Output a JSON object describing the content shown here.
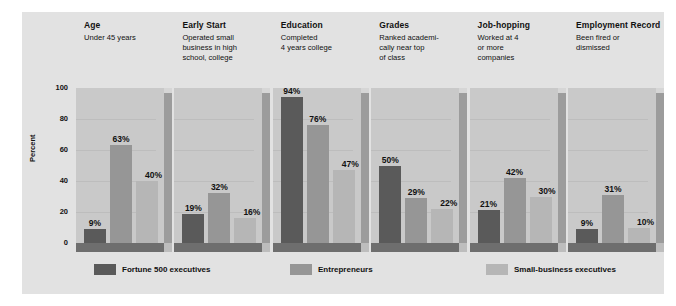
{
  "chart_data": {
    "type": "bar",
    "title": "",
    "xlabel": "",
    "ylabel": "Percent",
    "ylim": [
      0,
      100
    ],
    "yticks": [
      0,
      20,
      40,
      60,
      80,
      100
    ],
    "grid": true,
    "legend_position": "bottom",
    "categories": [
      "Age",
      "Early Start",
      "Education",
      "Grades",
      "Job-hopping",
      "Employment Record"
    ],
    "category_subtitles": [
      "Under 45 years",
      "Operated small\nbusiness in high\nschool, college",
      "Completed\n4 years college",
      "Ranked academi-\ncally near top\nof class",
      "Worked at 4\nor more\ncompanies",
      "Been fired or\ndismissed"
    ],
    "series": [
      {
        "name": "Fortune 500 executives",
        "color": "#5a5a5a",
        "values": [
          9,
          19,
          94,
          50,
          21,
          9
        ]
      },
      {
        "name": "Entrepreneurs",
        "color": "#969696",
        "values": [
          63,
          32,
          76,
          29,
          42,
          31
        ]
      },
      {
        "name": "Small-business executives",
        "color": "#b6b6b6",
        "values": [
          40,
          16,
          47,
          22,
          30,
          10
        ]
      }
    ],
    "value_labels": [
      [
        "9%",
        "63%",
        "40%"
      ],
      [
        "19%",
        "32%",
        "16%"
      ],
      [
        "94%",
        "76%",
        "47%"
      ],
      [
        "50%",
        "29%",
        "22%"
      ],
      [
        "21%",
        "42%",
        "30%"
      ],
      [
        "9%",
        "31%",
        "10%"
      ]
    ],
    "ytick_labels": [
      "0",
      "20",
      "40",
      "60",
      "80",
      "100"
    ]
  },
  "colors": {
    "background": "#e2e2e2",
    "panel_face": "#c9c9c9",
    "panel_side": "#9c9c9c",
    "shelf": "#6e6e6e",
    "gridline": "#bdbdbd",
    "text": "#111111"
  }
}
